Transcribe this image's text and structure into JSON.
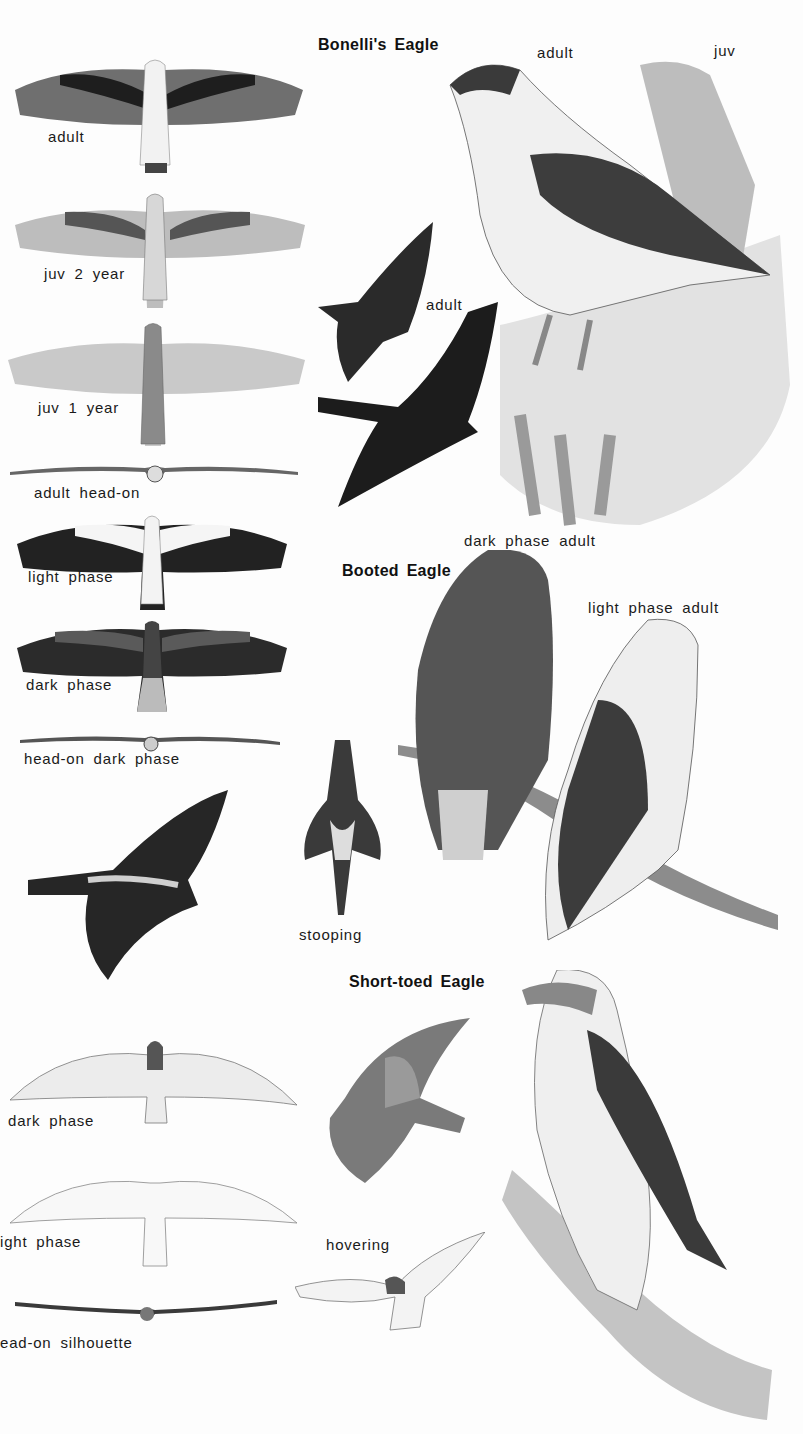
{
  "plate": {
    "species": [
      {
        "name": "Bonelli's Eagle",
        "figures": {
          "flight_adult": "adult",
          "flight_juv2": "juv  2  year",
          "flight_juv1": "juv  1  year",
          "head_on": "adult  head-on",
          "perched_adult": "adult",
          "perched_juv": "juv",
          "flying_adult": "adult"
        }
      },
      {
        "name": "Booted Eagle",
        "figures": {
          "flight_light": "light  phase",
          "flight_dark": "dark  phase",
          "head_on_dark": "head-on  dark  phase",
          "perched_dark": "dark  phase  adult",
          "perched_light": "light  phase  adult",
          "stooping": "stooping"
        }
      },
      {
        "name": "Short-toed Eagle",
        "figures": {
          "flight_dark": "dark  phase",
          "flight_light": "ight  phase",
          "head_on": "ead-on  silhouette",
          "hovering": "hovering"
        }
      }
    ]
  },
  "colors": {
    "background": "#fdfdfd",
    "ink": "#111111",
    "dark_plumage": "#2a2a2a",
    "mid_plumage": "#6f6f6f",
    "light_plumage": "#d9d9d9"
  }
}
